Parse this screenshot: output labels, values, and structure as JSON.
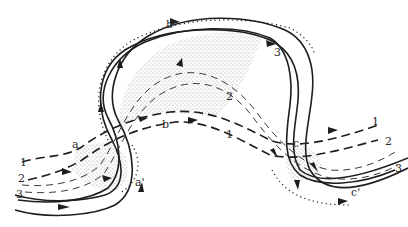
{
  "figure": {
    "flow_lines": [
      {
        "id": "1",
        "label": "1",
        "style": "heavy-dashed"
      },
      {
        "id": "2",
        "label": "2",
        "style": "light-dashed"
      },
      {
        "id": "3",
        "label": "3",
        "style": "solid"
      }
    ],
    "section_labels": {
      "a": "a",
      "a_prime": "a'",
      "b": "b",
      "b_prime": "b'",
      "c": "c",
      "c_prime": "c'"
    },
    "features": [
      "eroding outer bank (hatched)",
      "point bar deposits (stippled)",
      "flow direction arrows"
    ]
  }
}
